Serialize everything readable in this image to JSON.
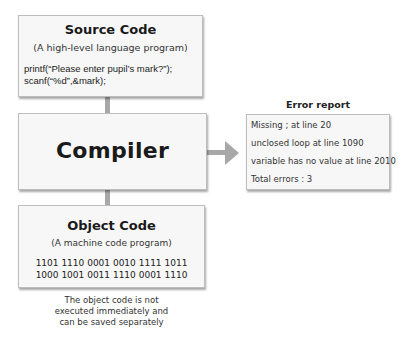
{
  "source": {
    "title": "Source Code",
    "subtitle": "(A high-level language program)",
    "code_lines": [
      "printf(“Please enter pupil’s mark?”);",
      "scanf(“%d”,&mark);"
    ]
  },
  "compiler": {
    "title": "Compiler"
  },
  "object": {
    "title": "Object Code",
    "subtitle": "(A machine code program)",
    "binary_lines": [
      "1101 1110 0001 0010 1111 1011",
      "1000 1001 0011 1110 0001 1110"
    ],
    "note_lines": [
      "The object code is not",
      "executed immediately and",
      "can be saved separately"
    ]
  },
  "error_report": {
    "title": "Error report",
    "lines": [
      "Missing ; at line 20",
      "unclosed loop at line 1090",
      "variable has no value at line 2010",
      "Total errors : 3"
    ]
  },
  "colors": {
    "arrow": "#a8a8a8",
    "box_fill": "#f7f7f7",
    "box_border": "#bdbdbd"
  }
}
